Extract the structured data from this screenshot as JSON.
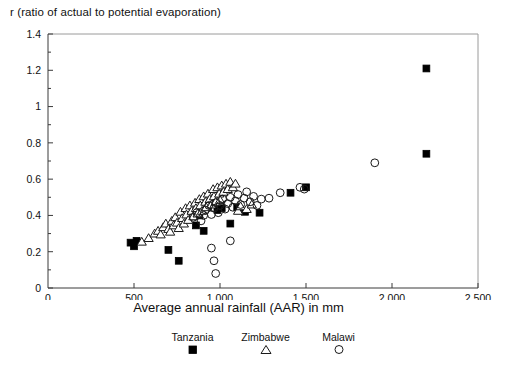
{
  "chart_data": {
    "type": "scatter",
    "title": "",
    "ylabel": "r (ratio of actual to potential evaporation)",
    "xlabel": "Average annual rainfall (AAR) in mm",
    "xlim": [
      0,
      2500
    ],
    "ylim": [
      0,
      1.4
    ],
    "xticks": [
      "0",
      "500",
      "1,000",
      "1,500",
      "2,000",
      "2,500"
    ],
    "xtick_values": [
      0,
      500,
      1000,
      1500,
      2000,
      2500
    ],
    "yticks": [
      "0",
      "0.2",
      "0.4",
      "0.6",
      "0.8",
      "1",
      "1.2",
      "1.4"
    ],
    "ytick_values": [
      0,
      0.2,
      0.4,
      0.6,
      0.8,
      1.0,
      1.2,
      1.4
    ],
    "y_minor_step": 0.1,
    "grid": false,
    "legend_position": "below-axis-center",
    "series": [
      {
        "name": "Tanzania",
        "marker": "filled-square",
        "color": "#000000",
        "points": [
          [
            480,
            0.25
          ],
          [
            500,
            0.23
          ],
          [
            515,
            0.26
          ],
          [
            700,
            0.21
          ],
          [
            760,
            0.15
          ],
          [
            860,
            0.345
          ],
          [
            880,
            0.4
          ],
          [
            905,
            0.315
          ],
          [
            930,
            0.45
          ],
          [
            950,
            0.47
          ],
          [
            985,
            0.43
          ],
          [
            1010,
            0.44
          ],
          [
            1060,
            0.355
          ],
          [
            1100,
            0.445
          ],
          [
            1145,
            0.42
          ],
          [
            1230,
            0.415
          ],
          [
            1410,
            0.525
          ],
          [
            1500,
            0.555
          ],
          [
            2200,
            1.21
          ],
          [
            2200,
            0.74
          ]
        ]
      },
      {
        "name": "Zimbabwe",
        "marker": "open-triangle",
        "color": "#1a1a1a",
        "points": [
          [
            545,
            0.255
          ],
          [
            585,
            0.275
          ],
          [
            620,
            0.3
          ],
          [
            640,
            0.315
          ],
          [
            655,
            0.295
          ],
          [
            670,
            0.335
          ],
          [
            685,
            0.355
          ],
          [
            700,
            0.325
          ],
          [
            710,
            0.31
          ],
          [
            720,
            0.37
          ],
          [
            730,
            0.345
          ],
          [
            740,
            0.39
          ],
          [
            750,
            0.36
          ],
          [
            760,
            0.33
          ],
          [
            770,
            0.42
          ],
          [
            780,
            0.385
          ],
          [
            790,
            0.355
          ],
          [
            800,
            0.44
          ],
          [
            805,
            0.405
          ],
          [
            815,
            0.375
          ],
          [
            825,
            0.455
          ],
          [
            835,
            0.425
          ],
          [
            845,
            0.395
          ],
          [
            855,
            0.47
          ],
          [
            860,
            0.44
          ],
          [
            870,
            0.41
          ],
          [
            880,
            0.49
          ],
          [
            885,
            0.455
          ],
          [
            895,
            0.425
          ],
          [
            905,
            0.505
          ],
          [
            915,
            0.475
          ],
          [
            920,
            0.445
          ],
          [
            930,
            0.52
          ],
          [
            940,
            0.49
          ],
          [
            950,
            0.46
          ],
          [
            960,
            0.545
          ],
          [
            965,
            0.505
          ],
          [
            975,
            0.475
          ],
          [
            985,
            0.555
          ],
          [
            995,
            0.52
          ],
          [
            1000,
            0.485
          ],
          [
            1010,
            0.565
          ],
          [
            1020,
            0.53
          ],
          [
            1035,
            0.575
          ],
          [
            1045,
            0.545
          ],
          [
            1060,
            0.585
          ],
          [
            1075,
            0.555
          ],
          [
            1090,
            0.575
          ],
          [
            1105,
            0.425
          ],
          [
            1120,
            0.45
          ],
          [
            1155,
            0.435
          ],
          [
            1185,
            0.46
          ]
        ]
      },
      {
        "name": "Malawi",
        "marker": "open-circle",
        "color": "#1a1a1a",
        "points": [
          [
            845,
            0.39
          ],
          [
            865,
            0.415
          ],
          [
            890,
            0.37
          ],
          [
            905,
            0.4
          ],
          [
            915,
            0.43
          ],
          [
            935,
            0.455
          ],
          [
            950,
            0.405
          ],
          [
            965,
            0.44
          ],
          [
            975,
            0.47
          ],
          [
            990,
            0.415
          ],
          [
            1000,
            0.455
          ],
          [
            1015,
            0.49
          ],
          [
            1030,
            0.435
          ],
          [
            1045,
            0.465
          ],
          [
            1060,
            0.5
          ],
          [
            1075,
            0.445
          ],
          [
            1090,
            0.48
          ],
          [
            1105,
            0.515
          ],
          [
            1120,
            0.46
          ],
          [
            1140,
            0.495
          ],
          [
            1155,
            0.53
          ],
          [
            1175,
            0.475
          ],
          [
            1195,
            0.505
          ],
          [
            1215,
            0.455
          ],
          [
            1240,
            0.49
          ],
          [
            1285,
            0.495
          ],
          [
            1350,
            0.525
          ],
          [
            1465,
            0.555
          ],
          [
            1490,
            0.545
          ],
          [
            1900,
            0.69
          ],
          [
            950,
            0.22
          ],
          [
            965,
            0.15
          ],
          [
            975,
            0.08
          ],
          [
            1060,
            0.26
          ]
        ]
      }
    ]
  },
  "legend": {
    "entries": [
      {
        "label": "Tanzania",
        "marker": "filled-square"
      },
      {
        "label": "Zimbabwe",
        "marker": "open-triangle"
      },
      {
        "label": "Malawi",
        "marker": "open-circle"
      }
    ]
  }
}
